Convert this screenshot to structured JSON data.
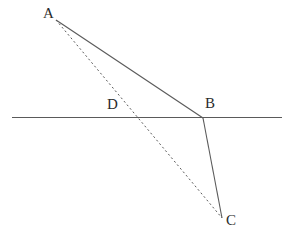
{
  "figure": {
    "background_color": "#ffffff",
    "stroke_color": "#5a5a5a",
    "label_color": "#2b2b2b",
    "solid_stroke_width": 1.1,
    "dashed_stroke_width": 1.0,
    "dash_pattern": "2,2.6"
  },
  "points": {
    "A": {
      "label": "A",
      "x": 56,
      "y": 20,
      "label_x": 43,
      "label_y": 6
    },
    "B": {
      "label": "B",
      "x": 203,
      "y": 118,
      "label_x": 205,
      "label_y": 96
    },
    "C": {
      "label": "C",
      "x": 222,
      "y": 218,
      "label_x": 226,
      "label_y": 213
    },
    "D": {
      "label": "D",
      "x": 139,
      "y": 118,
      "label_x": 107,
      "label_y": 97
    }
  },
  "segments": [
    {
      "name": "interface-line",
      "style": "solid",
      "x1": 12,
      "y1": 117.5,
      "x2": 282,
      "y2": 117.5
    },
    {
      "name": "incident-ray-AB",
      "style": "solid",
      "x1": 56,
      "y1": 20,
      "x2": 203,
      "y2": 118
    },
    {
      "name": "refracted-ray-BC",
      "style": "solid",
      "x1": 203,
      "y1": 118,
      "x2": 222,
      "y2": 218
    },
    {
      "name": "straight-path-AC",
      "style": "dashed",
      "x1": 56,
      "y1": 20,
      "x2": 222,
      "y2": 218
    }
  ]
}
